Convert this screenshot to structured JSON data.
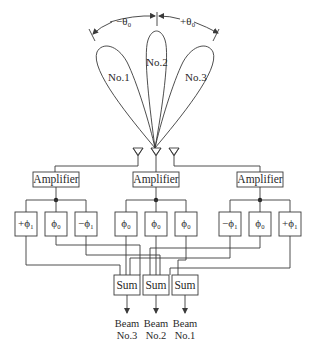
{
  "angles": {
    "left": "−θ₀",
    "right": "+θ₀"
  },
  "lobes": [
    {
      "label": "No.1"
    },
    {
      "label": "No.2"
    },
    {
      "label": "No.3"
    }
  ],
  "amplifiers": [
    {
      "label": "Amplifier"
    },
    {
      "label": "Amplifier"
    },
    {
      "label": "Amplifier"
    }
  ],
  "phase_shifters": [
    [
      "+ϕ₁",
      "ϕ₀",
      "−ϕ₁"
    ],
    [
      "ϕ₀",
      "ϕ₀",
      "ϕ₀"
    ],
    [
      "−ϕ₁",
      "ϕ₀",
      "+ϕ₁"
    ]
  ],
  "sums": [
    {
      "label": "Sum"
    },
    {
      "label": "Sum"
    },
    {
      "label": "Sum"
    }
  ],
  "beams": [
    {
      "line1": "Beam",
      "line2": "No.3"
    },
    {
      "line1": "Beam",
      "line2": "No.2"
    },
    {
      "line1": "Beam",
      "line2": "No.1"
    }
  ]
}
